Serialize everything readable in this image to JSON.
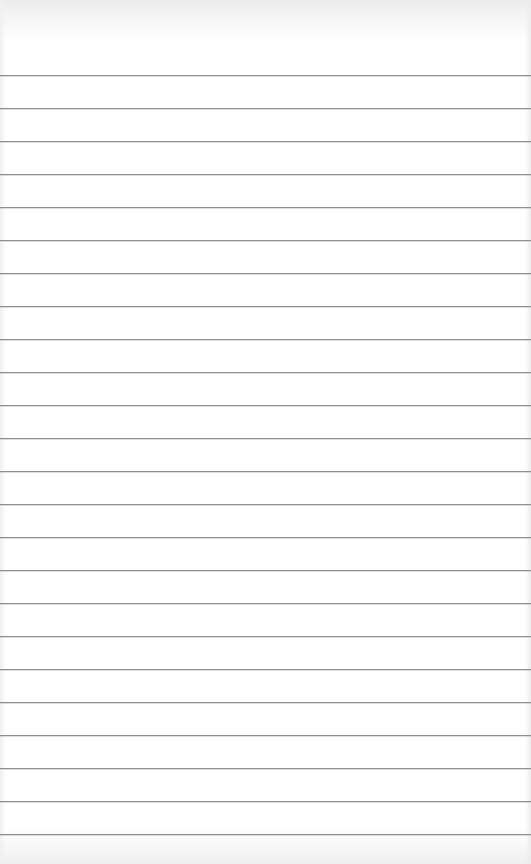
{
  "page": {
    "type": "lined-paper",
    "background_color": "#ffffff",
    "rule_color": "#8f8f8f",
    "first_rule_y": 75,
    "rule_spacing": 33,
    "rule_count": 24
  }
}
